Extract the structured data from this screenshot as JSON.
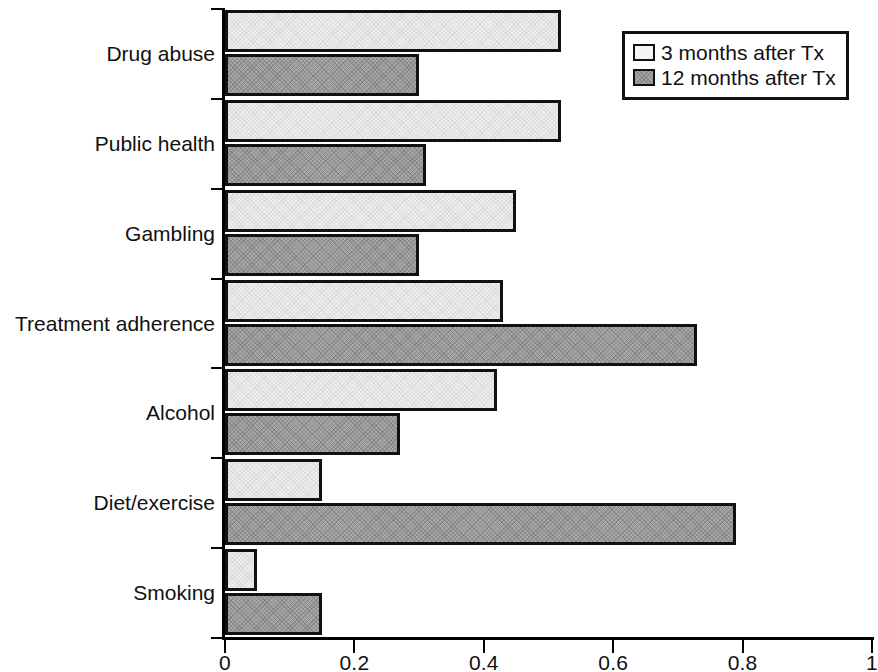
{
  "chart_data": {
    "type": "bar",
    "orientation": "horizontal",
    "title": "",
    "subtitle": "",
    "xlabel": "",
    "ylabel": "",
    "xlim": [
      0,
      1
    ],
    "grid": false,
    "legend_position": "top-right",
    "categories": [
      "Drug abuse",
      "Public health",
      "Gambling",
      "Treatment adherence",
      "Alcohol",
      "Diet/exercise",
      "Smoking"
    ],
    "series": [
      {
        "name": "3 months after Tx",
        "fill": "light",
        "values": [
          0.52,
          0.52,
          0.45,
          0.43,
          0.42,
          0.15,
          0.05
        ]
      },
      {
        "name": "12 months after Tx",
        "fill": "dark-hatched",
        "values": [
          0.3,
          0.31,
          0.3,
          0.73,
          0.27,
          0.79,
          0.15
        ]
      }
    ],
    "xticks": [
      {
        "value": 0,
        "label": "0"
      },
      {
        "value": 0.2,
        "label": "0.2"
      },
      {
        "value": 0.4,
        "label": "0.4"
      },
      {
        "value": 0.6,
        "label": "0.6"
      },
      {
        "value": 0.8,
        "label": "0.8"
      },
      {
        "value": 1,
        "label": "1"
      }
    ],
    "colors": {
      "series_3_months": "#eeeeee",
      "series_12_months": "#a8a8a8",
      "axis": "#000000",
      "bar_outline": "#111111",
      "background": "#ffffff"
    }
  },
  "legend": {
    "items": [
      {
        "label": "3 months after Tx"
      },
      {
        "label": "12 months after Tx"
      }
    ]
  }
}
